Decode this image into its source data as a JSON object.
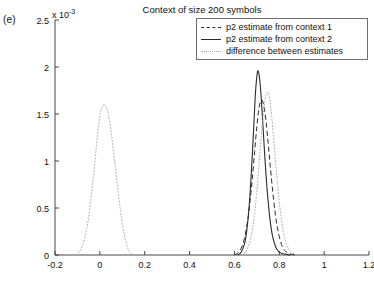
{
  "panel": {
    "label": "(e)"
  },
  "chart_data": {
    "type": "line",
    "title": "Context of size 200 symbols",
    "xlabel": "",
    "ylabel": "",
    "y_exponent_label": "x 10",
    "y_exponent_power": "-3",
    "y_scale_factor": 0.001,
    "xlim": [
      -0.2,
      1.2
    ],
    "ylim": [
      0,
      0.0025
    ],
    "xticks": [
      "-0.2",
      "0",
      "0.2",
      "0.4",
      "0.6",
      "0.8",
      "1",
      "1.2"
    ],
    "xtick_values": [
      -0.2,
      0,
      0.2,
      0.4,
      0.6,
      0.8,
      1,
      1.2
    ],
    "yticks": [
      "0",
      "0.5",
      "1",
      "1.5",
      "2",
      "2.5"
    ],
    "ytick_values": [
      0,
      0.0005,
      0.001,
      0.0015,
      0.002,
      0.0025
    ],
    "grid": false,
    "legend_position": "top-right",
    "series": [
      {
        "name": "p2 estimate from context 1",
        "style": "dashed",
        "color": "#2a2a2a",
        "peak_x": 0.72,
        "peak_y": 0.00165,
        "x": [
          0.6,
          0.615,
          0.63,
          0.645,
          0.66,
          0.67,
          0.68,
          0.69,
          0.7,
          0.71,
          0.72,
          0.73,
          0.74,
          0.75,
          0.76,
          0.775,
          0.79,
          0.805,
          0.82,
          0.84,
          0.87
        ],
        "y": [
          0.0,
          2e-05,
          7e-05,
          0.00018,
          0.00038,
          0.00058,
          0.00082,
          0.0011,
          0.00137,
          0.00157,
          0.00165,
          0.0016,
          0.00144,
          0.0012,
          0.00094,
          0.00058,
          0.00031,
          0.00015,
          6e-05,
          2e-05,
          0.0
        ]
      },
      {
        "name": "p2 estimate from context 2",
        "style": "solid",
        "color": "#2a2a2a",
        "peak_x": 0.705,
        "peak_y": 0.00196,
        "x": [
          0.615,
          0.63,
          0.645,
          0.655,
          0.665,
          0.675,
          0.685,
          0.693,
          0.7,
          0.705,
          0.712,
          0.72,
          0.728,
          0.737,
          0.747,
          0.758,
          0.77,
          0.785,
          0.8,
          0.82,
          0.85
        ],
        "y": [
          0.0,
          3e-05,
          0.00012,
          0.00026,
          0.0005,
          0.00086,
          0.00131,
          0.0017,
          0.0019,
          0.00196,
          0.00188,
          0.00166,
          0.00134,
          0.00099,
          0.00066,
          0.00039,
          0.0002,
          8e-05,
          3e-05,
          1e-05,
          0.0
        ]
      },
      {
        "name": "difference between estimates",
        "style": "dotted",
        "color": "#a8a8a8",
        "peak_x": 0.02,
        "peak_y": 0.0016,
        "x": [
          -0.105,
          -0.09,
          -0.075,
          -0.06,
          -0.048,
          -0.036,
          -0.024,
          -0.012,
          0.0,
          0.01,
          0.02,
          0.032,
          0.044,
          0.056,
          0.068,
          0.08,
          0.092,
          0.104,
          0.116,
          0.13,
          0.145
        ],
        "y": [
          0.0,
          4e-05,
          0.00012,
          0.00026,
          0.00044,
          0.00067,
          0.00094,
          0.00124,
          0.00148,
          0.00157,
          0.0016,
          0.00155,
          0.00141,
          0.0012,
          0.00095,
          0.0007,
          0.00047,
          0.00028,
          0.00014,
          4e-05,
          0.0
        ]
      },
      {
        "name": "difference between estimates (right cluster)",
        "style": "dotted",
        "color": "#a8a8a8",
        "peak_x": 0.745,
        "peak_y": 0.00173,
        "x": [
          0.63,
          0.648,
          0.662,
          0.676,
          0.688,
          0.698,
          0.708,
          0.718,
          0.727,
          0.736,
          0.745,
          0.754,
          0.763,
          0.772,
          0.782,
          0.793,
          0.805,
          0.818,
          0.833,
          0.85,
          0.875
        ],
        "y": [
          0.0,
          3e-05,
          9e-05,
          0.00021,
          0.0004,
          0.00063,
          0.00091,
          0.0012,
          0.00146,
          0.00165,
          0.00173,
          0.0017,
          0.00155,
          0.00131,
          0.00103,
          0.00073,
          0.00046,
          0.00025,
          0.00011,
          4e-05,
          0.0
        ]
      }
    ],
    "legend": [
      {
        "label": "p2 estimate from context 1",
        "style": "dashed"
      },
      {
        "label": "p2 estimate from context 2",
        "style": "solid"
      },
      {
        "label": "difference between estimates",
        "style": "dotted"
      }
    ]
  }
}
